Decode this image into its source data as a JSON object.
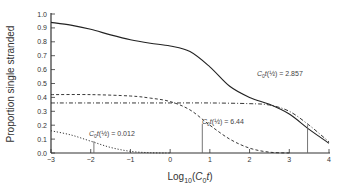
{
  "chart_data": {
    "type": "line",
    "title": "",
    "xlabel": "Log10(C0t)",
    "xlabel_parts": {
      "main": "Log",
      "sub": "10",
      "open": "(",
      "var": "C",
      "var_sub": "0",
      "var2": "t",
      "close": ")"
    },
    "ylabel": "Proportion single stranded",
    "xlim": [
      -3,
      4
    ],
    "ylim": [
      0,
      1.0
    ],
    "x_ticks": [
      -3,
      -2,
      -1,
      0,
      1,
      2,
      3,
      4
    ],
    "x_tick_labels": [
      "-3",
      "-2",
      "-1",
      "0",
      "1",
      "2",
      "3",
      "4"
    ],
    "y_ticks": [
      0.0,
      0.1,
      0.2,
      0.3,
      0.4,
      0.5,
      0.6,
      0.7,
      0.8,
      0.9,
      1.0
    ],
    "y_tick_labels": [
      "0.0",
      "0.1",
      "0.2",
      "0.3",
      "0.4",
      "0.5",
      "0.6",
      "0.7",
      "0.8",
      "0.9",
      "1.0"
    ],
    "grid": false,
    "legend": null,
    "series": [
      {
        "name": "Total (sum of components)",
        "style": "solid",
        "x": [
          -3,
          -2.5,
          -2,
          -1.5,
          -1,
          -0.5,
          0,
          0.5,
          1,
          1.5,
          2,
          2.5,
          3,
          3.5,
          4
        ],
        "values": [
          0.94,
          0.92,
          0.89,
          0.85,
          0.815,
          0.79,
          0.77,
          0.73,
          0.62,
          0.48,
          0.4,
          0.35,
          0.28,
          0.17,
          0.07
        ]
      },
      {
        "name": "Component C0t(1/2) = 0.012",
        "style": "dotted",
        "x": [
          -3,
          -2.5,
          -2,
          -1.5,
          -1,
          -0.5,
          0
        ],
        "values": [
          0.16,
          0.13,
          0.085,
          0.04,
          0.012,
          0.002,
          0.0
        ]
      },
      {
        "name": "Component C0t(1/2) = 6.44",
        "style": "dashed",
        "x": [
          -3,
          -2,
          -1,
          -0.5,
          0,
          0.5,
          1,
          1.5,
          2,
          2.5,
          3
        ],
        "values": [
          0.42,
          0.42,
          0.41,
          0.395,
          0.37,
          0.31,
          0.2,
          0.1,
          0.035,
          0.006,
          0.0
        ]
      },
      {
        "name": "Component C0t(1/2) = 2.857",
        "style": "dash-dot",
        "x": [
          -3,
          -2,
          -1,
          0,
          1,
          2,
          2.5,
          3,
          3.5,
          4
        ],
        "values": [
          0.36,
          0.36,
          0.36,
          0.36,
          0.36,
          0.355,
          0.345,
          0.3,
          0.2,
          0.08
        ]
      }
    ],
    "markers": [
      {
        "x": -1.92,
        "y_top": 0.085,
        "label": "C0t(1/2) = 0.012"
      },
      {
        "x": 0.81,
        "y_top": 0.21,
        "label": "C0t(1/2) = 6.44"
      },
      {
        "x": 3.46,
        "y_top": 0.2,
        "label": "C0t(1/2) = 2.857"
      }
    ],
    "annotations": [
      {
        "text": "C0t(1/2) = 2.857",
        "x": 2.0,
        "y": 0.6
      },
      {
        "text": "C0t(1/2) = 6.44",
        "x": 1.0,
        "y": 0.255
      },
      {
        "text": "C0t(1/2) = 0.012",
        "x": -2.1,
        "y": 0.13
      }
    ]
  },
  "labels": {
    "annot_1": {
      "c": "C",
      "sub": "0",
      "t": "t",
      "half": "(½)",
      "value": " = 2.857"
    },
    "annot_2": {
      "c": "C",
      "sub": "0",
      "t": "t",
      "half": "(½)",
      "value": " = 6.44"
    },
    "annot_3": {
      "c": "C",
      "sub": "0",
      "t": "t",
      "half": "(½)",
      "value": " = 0.012"
    }
  }
}
